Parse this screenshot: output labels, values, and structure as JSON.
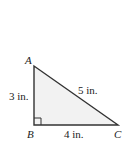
{
  "diagram": {
    "type": "right-triangle",
    "vertices": {
      "A": {
        "label": "A",
        "x": 34,
        "y": 66
      },
      "B": {
        "label": "B",
        "x": 34,
        "y": 125
      },
      "C": {
        "label": "C",
        "x": 118,
        "y": 125
      }
    },
    "sides": {
      "AB": {
        "label": "3 in."
      },
      "BC": {
        "label": "4 in."
      },
      "AC": {
        "label": "5 in."
      }
    },
    "right_angle_at": "B",
    "colors": {
      "fill": "#f2f2f2",
      "stroke": "#333333"
    }
  }
}
